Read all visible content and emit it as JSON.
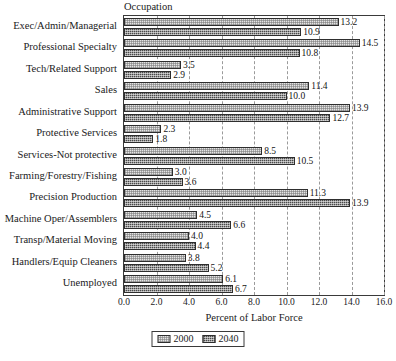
{
  "chart_data": {
    "type": "bar",
    "orientation": "horizontal",
    "title": "Occupation",
    "xlabel": "Percent of Labor Force",
    "ylabel": "",
    "xlim": [
      0.0,
      16.0
    ],
    "xticks": [
      "0.0",
      "2.0",
      "4.0",
      "6.0",
      "8.0",
      "10.0",
      "12.0",
      "14.0",
      "16.0"
    ],
    "xtick_values": [
      0,
      2,
      4,
      6,
      8,
      10,
      12,
      14,
      16
    ],
    "grid": "vertical-dashed",
    "legend_position": "bottom-center",
    "categories": [
      "Exec/Admin/Managerial",
      "Professional Specialty",
      "Tech/Related Support",
      "Sales",
      "Administrative Support",
      "Protective Services",
      "Services-Not protective",
      "Farming/Forestry/Fishing",
      "Precision Production",
      "Machine Oper/Assemblers",
      "Transp/Material Moving",
      "Handlers/Equip Cleaners",
      "Unemployed"
    ],
    "series": [
      {
        "name": "2000",
        "values": [
          13.2,
          14.5,
          3.5,
          11.4,
          13.9,
          2.3,
          8.5,
          3.0,
          11.3,
          4.5,
          4.0,
          3.8,
          6.1
        ],
        "labels": [
          "13.2",
          "14.5",
          "3.5",
          "11.4",
          "13.9",
          "2.3",
          "8.5",
          "3.0",
          "11.3",
          "4.5",
          "4.0",
          "3.8",
          "6.1"
        ],
        "color": "#e4e4e4",
        "pattern": "light-speckle"
      },
      {
        "name": "2040",
        "values": [
          10.9,
          10.8,
          2.9,
          10.0,
          12.7,
          1.8,
          10.5,
          3.6,
          13.9,
          6.6,
          4.4,
          5.2,
          6.7
        ],
        "labels": [
          "10.9",
          "10.8",
          "2.9",
          "10.0",
          "12.7",
          "1.8",
          "10.5",
          "3.6",
          "13.9",
          "6.6",
          "4.4",
          "5.2",
          "6.7"
        ],
        "color": "#4a4a4a",
        "pattern": "dark-crosshatch"
      }
    ]
  },
  "legend": {
    "entries": [
      {
        "label": "2000"
      },
      {
        "label": "2040"
      }
    ]
  }
}
